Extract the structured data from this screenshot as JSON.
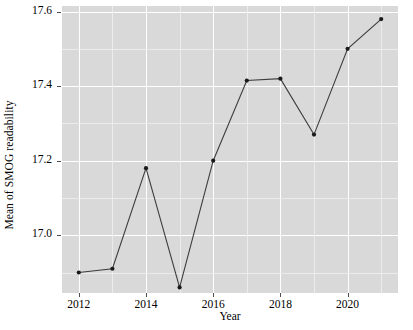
{
  "chart_data": {
    "type": "line",
    "title": "",
    "xlabel": "Year",
    "ylabel": "Mean of SMOG readability",
    "x": [
      2012,
      2013,
      2014,
      2015,
      2016,
      2017,
      2018,
      2019,
      2020,
      2021
    ],
    "values": [
      16.9,
      16.91,
      17.18,
      16.86,
      17.2,
      17.415,
      17.42,
      17.27,
      17.5,
      17.58
    ],
    "series": [
      {
        "name": "Mean of SMOG readability",
        "values": [
          16.9,
          16.91,
          17.18,
          16.86,
          17.2,
          17.415,
          17.42,
          17.27,
          17.5,
          17.58
        ]
      }
    ],
    "xlim": [
      2011.5,
      2021.5
    ],
    "ylim": [
      16.845,
      17.615
    ],
    "x_ticks": [
      2012,
      2014,
      2016,
      2018,
      2020
    ],
    "x_tick_labels": [
      "2012",
      "2014",
      "2016",
      "2018",
      "2020"
    ],
    "y_ticks": [
      17.0,
      17.2,
      17.4,
      17.6
    ],
    "y_tick_labels": [
      "17.0",
      "17.2",
      "17.4",
      "17.6"
    ],
    "y_minor_ticks": [
      16.9,
      17.1,
      17.3,
      17.5
    ],
    "x_minor_ticks": [
      2013,
      2015,
      2017,
      2019,
      2021
    ],
    "grid": true,
    "legend": "none",
    "marker": "filled-circle",
    "line_color": "#3d3d3d",
    "point_color": "#1a1a1a",
    "panel_background": "#d9d9d9",
    "major_grid_color": "#ffffff",
    "minor_grid_color": "#ececec",
    "plot_background": "#ffffff"
  }
}
